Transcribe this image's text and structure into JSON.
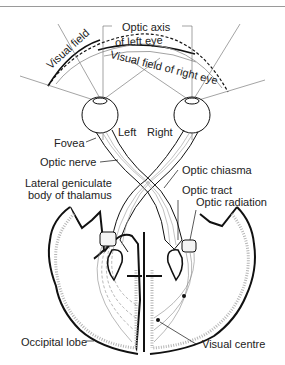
{
  "figure": {
    "labels": {
      "optic_axis": "Optic axis",
      "visual_field_left_1": "Visual field",
      "visual_field_left_2": "of left eye",
      "visual_field_right": "Visual field of right eye",
      "left": "Left",
      "right": "Right",
      "fovea": "Fovea",
      "optic_nerve": "Optic nerve",
      "optic_chiasma": "Optic chiasma",
      "lgn_1": "Lateral geniculate",
      "lgn_2": "body of thalamus",
      "optic_tract": "Optic tract",
      "optic_radiation": "Optic radiation",
      "occipital_lobe": "Occipital lobe",
      "visual_centre": "Visual centre"
    },
    "colors": {
      "ink": "#111111",
      "gray_line": "#8a8a8a",
      "stipple": "#b5b5b5",
      "background": "#ffffff"
    }
  }
}
